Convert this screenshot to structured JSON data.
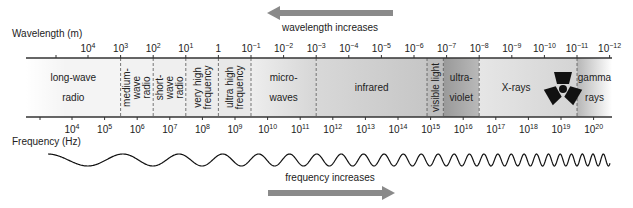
{
  "title_arrows": {
    "wavelength_label": "wavelength increases",
    "frequency_label": "frequency increases",
    "arrow_color": "#8a8a8a"
  },
  "wavelength_axis": {
    "label": "Wavelength (m)",
    "ticks": [
      {
        "base": "10",
        "exp": "4"
      },
      {
        "base": "10",
        "exp": "3"
      },
      {
        "base": "10",
        "exp": "2"
      },
      {
        "base": "10",
        "exp": "1"
      },
      {
        "base": "1",
        "exp": ""
      },
      {
        "base": "10",
        "exp": "−1"
      },
      {
        "base": "10",
        "exp": "−2"
      },
      {
        "base": "10",
        "exp": "−3"
      },
      {
        "base": "10",
        "exp": "−4"
      },
      {
        "base": "10",
        "exp": "−5"
      },
      {
        "base": "10",
        "exp": "−6"
      },
      {
        "base": "10",
        "exp": "−7"
      },
      {
        "base": "10",
        "exp": "−8"
      },
      {
        "base": "10",
        "exp": "−9"
      },
      {
        "base": "10",
        "exp": "−10"
      },
      {
        "base": "10",
        "exp": "−11"
      },
      {
        "base": "10",
        "exp": "−12"
      }
    ]
  },
  "frequency_axis": {
    "label": "Frequency (Hz)",
    "ticks": [
      {
        "base": "10",
        "exp": "4"
      },
      {
        "base": "10",
        "exp": "5"
      },
      {
        "base": "10",
        "exp": "6"
      },
      {
        "base": "10",
        "exp": "7"
      },
      {
        "base": "10",
        "exp": "8"
      },
      {
        "base": "10",
        "exp": "9"
      },
      {
        "base": "10",
        "exp": "10"
      },
      {
        "base": "10",
        "exp": "11"
      },
      {
        "base": "10",
        "exp": "12"
      },
      {
        "base": "10",
        "exp": "13"
      },
      {
        "base": "10",
        "exp": "14"
      },
      {
        "base": "10",
        "exp": "15"
      },
      {
        "base": "10",
        "exp": "16"
      },
      {
        "base": "10",
        "exp": "17"
      },
      {
        "base": "10",
        "exp": "18"
      },
      {
        "base": "10",
        "exp": "19"
      },
      {
        "base": "10",
        "exp": "20"
      }
    ]
  },
  "bands": [
    {
      "name": "long-wave-radio",
      "lines": [
        "long-wave",
        "radio"
      ],
      "vertical": false,
      "color": "#f4f4f4"
    },
    {
      "name": "medium-wave-radio",
      "lines": [
        "medium-",
        "wave",
        "radio"
      ],
      "vertical": true,
      "color": "#f2f2f2"
    },
    {
      "name": "short-wave-radio",
      "lines": [
        "short-",
        "wave",
        "radio"
      ],
      "vertical": true,
      "color": "#efefef"
    },
    {
      "name": "very-high-frequency",
      "lines": [
        "very high",
        "frequency"
      ],
      "vertical": true,
      "color": "#ececec"
    },
    {
      "name": "ultra-high-frequency",
      "lines": [
        "ultra high",
        "frequency"
      ],
      "vertical": true,
      "color": "#e8e8e8"
    },
    {
      "name": "microwaves",
      "lines": [
        "micro-",
        "waves"
      ],
      "vertical": false,
      "color": "#e2e2e2"
    },
    {
      "name": "infrared",
      "lines": [
        "infrared"
      ],
      "vertical": false,
      "color": "#cfcfcf"
    },
    {
      "name": "visible-light",
      "lines": [
        "visible light"
      ],
      "vertical": true,
      "color": "#bdbdbd"
    },
    {
      "name": "ultraviolet",
      "lines": [
        "ultra-",
        "violet"
      ],
      "vertical": false,
      "color": "#a9a9a9"
    },
    {
      "name": "x-rays",
      "lines": [
        "X-rays"
      ],
      "vertical": false,
      "color": "#dcdcdc"
    },
    {
      "name": "gamma-rays",
      "lines": [
        "gamma",
        "rays"
      ],
      "vertical": false,
      "color": "#c4c4c4"
    }
  ],
  "band_boundaries_log_wavelength_m": [
    4.6,
    3,
    2,
    1,
    0,
    -1,
    -3,
    -6.4,
    -6.9,
    -8,
    -11,
    -12.4
  ]
}
